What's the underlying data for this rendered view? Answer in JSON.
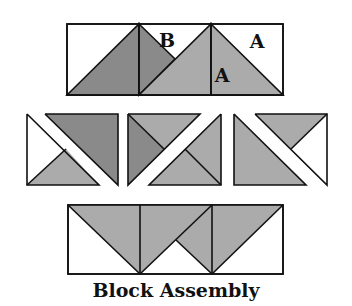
{
  "title": "Block Assembly",
  "colors": {
    "dark": "#8a8a8a",
    "light": "#ababab",
    "white": "#ffffff",
    "stroke": "#111111"
  },
  "labels": [
    {
      "text": "B",
      "x": 167,
      "y": 47
    },
    {
      "text": "A",
      "x": 257,
      "y": 48
    },
    {
      "text": "A",
      "x": 222,
      "y": 82
    }
  ],
  "top_strip": {
    "rect": [
      67,
      24,
      283,
      95
    ],
    "verticals": [
      139,
      211
    ],
    "shapes": [
      {
        "fill": "dark",
        "points": "67,95 139,24 139,95"
      },
      {
        "fill": "dark",
        "points": "139,24 175,59 139,95"
      },
      {
        "fill": "light",
        "points": "139,95 211,24 211,95"
      },
      {
        "fill": "light",
        "points": "211,24 283,95 211,95"
      }
    ]
  },
  "middle_row": [
    {
      "rect": [
        27,
        114,
        118,
        185
      ],
      "shapes": [
        {
          "fill": "white",
          "points": "27,114 66,149 27,185"
        },
        {
          "fill": "light",
          "points": "27,185 66,149 99,185"
        },
        {
          "fill": "dark",
          "points": "45,114 118,114 118,185"
        }
      ],
      "outlines": [
        "27,114 27,185 99,185 27,114",
        "45,114 118,114 118,185 45,114",
        "27,185 66,149"
      ]
    },
    {
      "rect": [
        128,
        114,
        221,
        185
      ],
      "shapes": [
        {
          "fill": "dark",
          "points": "128,114 164,149 128,185"
        },
        {
          "fill": "light",
          "points": "128,114 200,114 164,149"
        },
        {
          "fill": "light",
          "points": "221,114 221,185 185,149"
        },
        {
          "fill": "light",
          "points": "149,185 185,149 221,185"
        }
      ],
      "outlines": [
        "128,114 200,114 128,185 128,114",
        "221,114 221,185 149,185 221,114",
        "128,114 164,149",
        "185,149 221,185"
      ]
    },
    {
      "rect": [
        234,
        114,
        327,
        185
      ],
      "shapes": [
        {
          "fill": "light",
          "points": "234,114 306,185 234,185"
        },
        {
          "fill": "light",
          "points": "255,114 327,114 291,149"
        },
        {
          "fill": "white",
          "points": "327,114 327,185 291,149"
        }
      ],
      "outlines": [
        "234,114 306,185 234,185 234,114",
        "255,114 327,114 327,185 255,114",
        "327,114 291,149"
      ]
    }
  ],
  "bottom_strip": {
    "rect": [
      68,
      205,
      283,
      274
    ],
    "verticals": [
      140,
      212
    ],
    "shapes": [
      {
        "fill": "light",
        "points": "68,205 140,205 140,274"
      },
      {
        "fill": "light",
        "points": "140,205 212,205 140,274"
      },
      {
        "fill": "light",
        "points": "212,205 176,240 212,274"
      },
      {
        "fill": "light",
        "points": "212,205 283,205 212,274"
      }
    ],
    "extra_lines": [
      "68,205 140,274",
      "140,274 212,205",
      "176,240 212,274",
      "212,274 283,205"
    ]
  }
}
